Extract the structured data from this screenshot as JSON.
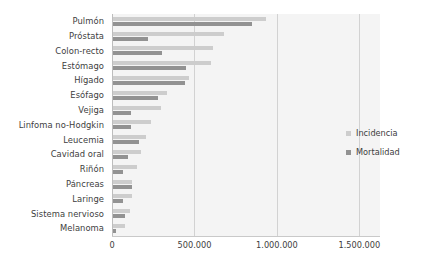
{
  "chart_data": {
    "type": "bar",
    "orientation": "horizontal",
    "title": "",
    "xlabel": "",
    "ylabel": "",
    "xlim": [
      0,
      1625000
    ],
    "grid": true,
    "gridlines_at": [
      0,
      500000,
      1000000,
      1500000
    ],
    "xticks": [
      "0",
      "500.000",
      "1.000.000",
      "1.500.000"
    ],
    "xtick_values": [
      0,
      500000,
      1000000,
      1500000
    ],
    "legend_position": "right",
    "categories": [
      "Pulmón",
      "Próstata",
      "Colon-recto",
      "Estómago",
      "Hígado",
      "Esófago",
      "Vejiga",
      "Linfoma no-Hodgkin",
      "Leucemia",
      "Cavidad oral",
      "Riñón",
      "Páncreas",
      "Laringe",
      "Sistema nervioso",
      "Melanoma"
    ],
    "series": [
      {
        "name": "Incidencia",
        "color": "#cdcdcd",
        "values": [
          933000,
          679000,
          615000,
          603000,
          465000,
          335000,
          297000,
          237000,
          207000,
          175000,
          154000,
          123000,
          124000,
          108000,
          79000
        ]
      },
      {
        "name": "Mortalidad",
        "color": "#929292",
        "values": [
          848000,
          221000,
          302000,
          446000,
          441000,
          277000,
          117000,
          114000,
          161000,
          95000,
          65000,
          120000,
          64000,
          78000,
          25000
        ]
      }
    ]
  },
  "legend": {
    "items": [
      {
        "label": "Incidencia",
        "color": "#cdcdcd"
      },
      {
        "label": "Mortalidad",
        "color": "#929292"
      }
    ]
  }
}
